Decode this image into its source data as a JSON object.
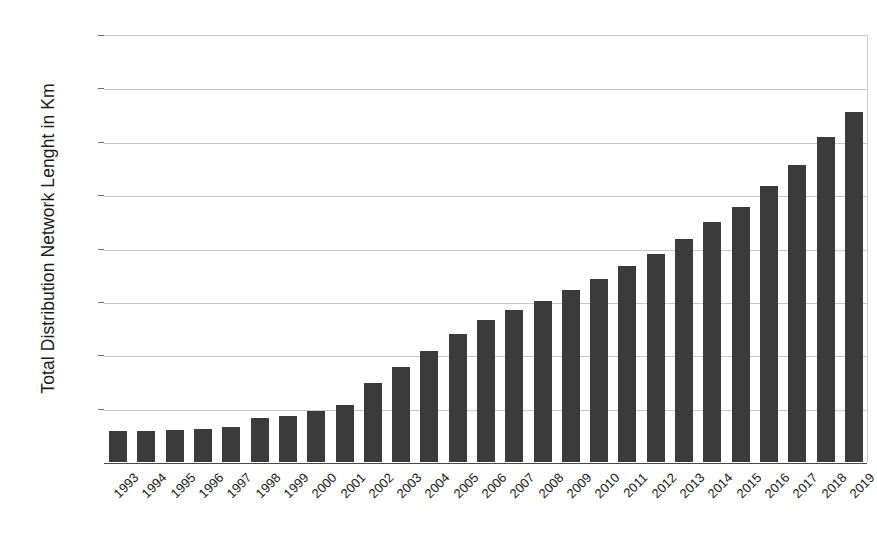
{
  "chart_data": {
    "type": "bar",
    "title": "",
    "xlabel": "",
    "ylabel": "Total Distribution Network Lenght in Km",
    "ylim": [
      0,
      4000
    ],
    "ytick_labels": [
      "4000",
      "3500",
      "3000",
      "2500",
      "2000",
      "1500",
      "1000",
      "500",
      "-"
    ],
    "ytick_values": [
      4000,
      3500,
      3000,
      2500,
      2000,
      1500,
      1000,
      500,
      0
    ],
    "grid": true,
    "legend": null,
    "bar_color": "#3b3b3b",
    "grid_color": "#c9c9c9",
    "categories": [
      "1993",
      "1994",
      "1995",
      "1996",
      "1997",
      "1998",
      "1999",
      "2000",
      "2001",
      "2002",
      "2003",
      "2004",
      "2005",
      "2006",
      "2007",
      "2008",
      "2009",
      "2010",
      "2011",
      "2012",
      "2013",
      "2014",
      "2015",
      "2016",
      "2017",
      "2018",
      "2019"
    ],
    "values": [
      295,
      295,
      300,
      310,
      330,
      415,
      435,
      480,
      530,
      740,
      890,
      1040,
      1200,
      1330,
      1420,
      1510,
      1610,
      1710,
      1840,
      1950,
      2090,
      2250,
      2390,
      2590,
      2780,
      3040,
      3280
    ]
  }
}
